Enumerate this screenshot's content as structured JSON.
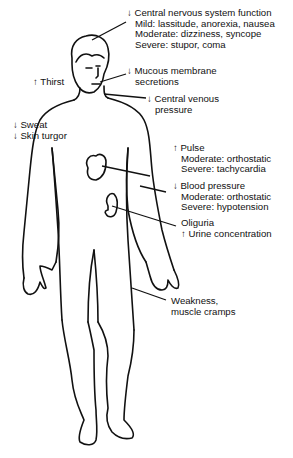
{
  "labels": {
    "cns": {
      "arrow": "↓",
      "title": "Central nervous system function",
      "lines": [
        "Mild:  lassitude, anorexia, nausea",
        "Moderate:  dizziness, syncope",
        "Severe:  stupor, coma"
      ]
    },
    "thirst": {
      "arrow": "↑",
      "title": "Thirst"
    },
    "mucous": {
      "arrow": "↓",
      "title": "Mucous membrane",
      "lines": [
        "secretions"
      ]
    },
    "cvp": {
      "arrow": "↓",
      "title": "Central venous",
      "lines": [
        "pressure"
      ]
    },
    "sweat": {
      "arrow": "↓",
      "title": "Sweat"
    },
    "turgor": {
      "arrow": "↓",
      "title": "Skin turgor"
    },
    "pulse": {
      "arrow": "↑",
      "title": "Pulse",
      "lines": [
        "Moderate:  orthostatic",
        "Severe:  tachycardia"
      ]
    },
    "bp": {
      "arrow": "↓",
      "title": "Blood pressure",
      "lines": [
        "Moderate:  orthostatic",
        "Severe:  hypotension"
      ]
    },
    "oliguria": {
      "title": "Oliguria"
    },
    "urine": {
      "arrow": "↑",
      "title": "Urine concentration"
    },
    "weakness": {
      "title": "Weakness,",
      "lines": [
        "muscle cramps"
      ]
    }
  },
  "colors": {
    "ink": "#111111",
    "background": "#ffffff"
  }
}
